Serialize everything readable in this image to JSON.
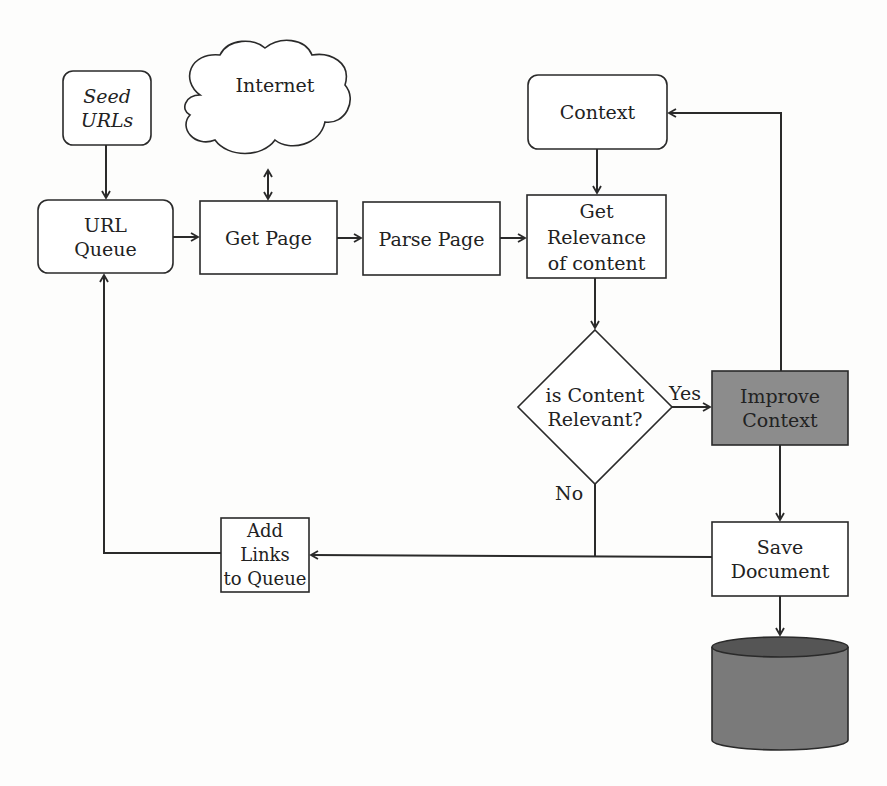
{
  "page": {
    "top_cut_text": ""
  },
  "nodes": {
    "seed_urls": {
      "line1": "Seed",
      "line2": "URLs"
    },
    "internet": {
      "label": "Internet"
    },
    "url_queue": {
      "line1": "URL",
      "line2": "Queue"
    },
    "get_page": {
      "label": "Get Page"
    },
    "parse_page": {
      "label": "Parse Page"
    },
    "context": {
      "label": "Context"
    },
    "get_relevance": {
      "line1": "Get",
      "line2": "Relevance",
      "line3": "of content"
    },
    "decision": {
      "line1": "is Content",
      "line2": "Relevant?"
    },
    "improve_context": {
      "line1": "Improve",
      "line2": "Context",
      "fill": "#8c8c8c"
    },
    "add_links": {
      "line1": "Add Links",
      "line2": "to Queue"
    },
    "save_document": {
      "line1": "Save",
      "line2": "Document"
    },
    "database": {
      "label": "",
      "fill": "#7a7a7a",
      "top_fill": "#555555"
    }
  },
  "edge_labels": {
    "yes": "Yes",
    "no": "No"
  },
  "colors": {
    "stroke": "#2a2a2a",
    "background": "#fdfdfc"
  }
}
